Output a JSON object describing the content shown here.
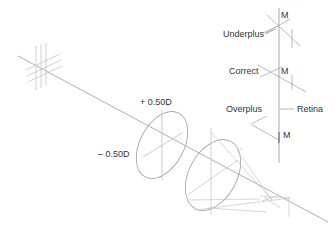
{
  "diagram": {
    "lens_labels": {
      "plus": "+ 0.50D",
      "minus": "– 0.50D"
    },
    "focus_labels": {
      "underplus": "Underplus",
      "correct": "Correct",
      "overplus": "Overplus",
      "retina": "Retina"
    },
    "markers": {
      "m_top": "M",
      "m_middle": "M",
      "m_bottom": "M"
    },
    "colors": {
      "line": "#9a9a9a",
      "light_line": "#c8c8c8",
      "text": "#333333"
    }
  }
}
